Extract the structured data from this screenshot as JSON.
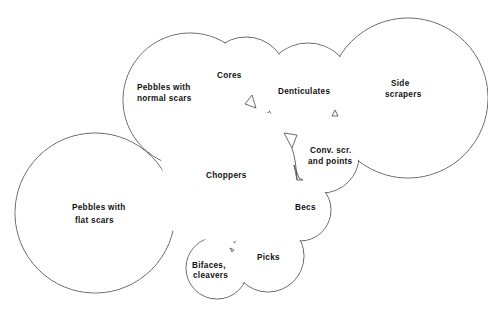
{
  "diagram": {
    "type": "overlapping-circles",
    "stroke_color": "#555555",
    "background": "#ffffff",
    "regions": [
      {
        "id": "pebbles-flat",
        "lines": [
          "Pebbles with",
          "flat scars"
        ],
        "cx": 95,
        "cy": 213,
        "r": 80
      },
      {
        "id": "pebbles-normal",
        "lines": [
          "Pebbles with",
          "normal scars"
        ],
        "cx": 190,
        "cy": 100,
        "r": 67
      },
      {
        "id": "cores",
        "lines": [
          "Cores"
        ],
        "cx": 246,
        "cy": 78,
        "r": 41
      },
      {
        "id": "denticulates",
        "lines": [
          "Denticulates"
        ],
        "cx": 308,
        "cy": 88,
        "r": 45
      },
      {
        "id": "side-scrapers",
        "lines": [
          "Side",
          "scrapers"
        ],
        "cx": 408,
        "cy": 98,
        "r": 80
      },
      {
        "id": "conv-scr",
        "lines": [
          "Conv. scr.",
          "and points"
        ],
        "cx": 322,
        "cy": 156,
        "r": 37
      },
      {
        "id": "becs",
        "lines": [
          "Becs"
        ],
        "cx": 300,
        "cy": 210,
        "r": 31
      },
      {
        "id": "picks",
        "lines": [
          "Picks"
        ],
        "cx": 268,
        "cy": 256,
        "r": 36
      },
      {
        "id": "bifaces",
        "lines": [
          "Bifaces,",
          "cleavers"
        ],
        "cx": 217,
        "cy": 268,
        "r": 31
      }
    ],
    "center_label": "Choppers",
    "labels": {
      "pebbles_flat_1": "Pebbles with",
      "pebbles_flat_2": "flat scars",
      "pebbles_normal_1": "Pebbles with",
      "pebbles_normal_2": "normal scars",
      "cores": "Cores",
      "denticulates": "Denticulates",
      "side_scrapers_1": "Side",
      "side_scrapers_2": "scrapers",
      "conv_scr_1": "Conv. scr.",
      "conv_scr_2": "and points",
      "choppers": "Choppers",
      "becs": "Becs",
      "picks": "Picks",
      "bifaces_1": "Bifaces,",
      "bifaces_2": "cleavers"
    }
  }
}
